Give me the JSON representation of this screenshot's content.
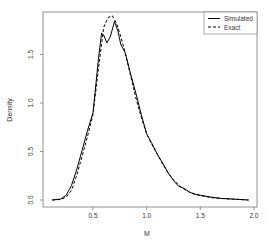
{
  "chart_data": {
    "type": "line",
    "title": "",
    "xlabel": "M",
    "ylabel": "Density",
    "xlim": [
      0.1,
      2.0
    ],
    "ylim": [
      0.0,
      1.9
    ],
    "x_ticks": [
      0.5,
      1.0,
      1.5,
      2.0
    ],
    "x_tick_labels": [
      "0.5",
      "1.0",
      "1.5",
      "2.0"
    ],
    "y_ticks": [
      0.0,
      0.5,
      1.0,
      1.5
    ],
    "y_tick_labels": [
      "0.0",
      "0.5",
      "1.0",
      "1.5"
    ],
    "grid": false,
    "legend_position": "topright",
    "series": [
      {
        "name": "Simulated",
        "style": "solid",
        "color": "#000000",
        "x": [
          0.12,
          0.2,
          0.25,
          0.3,
          0.35,
          0.4,
          0.45,
          0.5,
          0.55,
          0.58,
          0.6,
          0.63,
          0.66,
          0.7,
          0.73,
          0.76,
          0.8,
          0.85,
          0.9,
          0.95,
          1.0,
          1.05,
          1.1,
          1.15,
          1.2,
          1.25,
          1.3,
          1.35,
          1.4,
          1.45,
          1.5,
          1.6,
          1.7,
          1.8,
          1.95
        ],
        "y": [
          0.0,
          0.01,
          0.05,
          0.15,
          0.32,
          0.52,
          0.72,
          0.9,
          1.45,
          1.72,
          1.7,
          1.62,
          1.68,
          1.84,
          1.75,
          1.6,
          1.52,
          1.3,
          1.1,
          0.88,
          0.68,
          0.58,
          0.47,
          0.38,
          0.28,
          0.2,
          0.14,
          0.12,
          0.08,
          0.06,
          0.05,
          0.03,
          0.015,
          0.01,
          0.0
        ]
      },
      {
        "name": "Exact",
        "style": "dashed",
        "color": "#000000",
        "x": [
          0.12,
          0.2,
          0.25,
          0.3,
          0.35,
          0.4,
          0.45,
          0.5,
          0.55,
          0.6,
          0.64,
          0.68,
          0.72,
          0.76,
          0.8,
          0.85,
          0.9,
          0.95,
          1.0,
          1.05,
          1.1,
          1.15,
          1.2,
          1.25,
          1.3,
          1.35,
          1.4,
          1.45,
          1.5,
          1.6,
          1.7,
          1.8,
          1.95
        ],
        "y": [
          0.0,
          0.005,
          0.03,
          0.1,
          0.26,
          0.46,
          0.66,
          0.88,
          1.35,
          1.78,
          1.88,
          1.9,
          1.82,
          1.68,
          1.52,
          1.28,
          1.05,
          0.85,
          0.68,
          0.57,
          0.47,
          0.37,
          0.28,
          0.21,
          0.15,
          0.11,
          0.08,
          0.06,
          0.045,
          0.025,
          0.015,
          0.008,
          0.0
        ]
      }
    ]
  },
  "legend": {
    "items": [
      {
        "label": "Simulated",
        "style": "solid"
      },
      {
        "label": "Exact",
        "style": "dashed"
      }
    ]
  },
  "colors": {
    "axis": "#555555",
    "line": "#000000",
    "background": "#ffffff"
  }
}
